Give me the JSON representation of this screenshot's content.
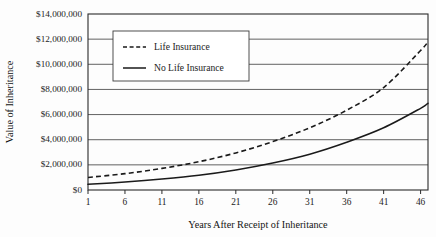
{
  "chart_data": {
    "type": "line",
    "title": "",
    "xlabel": "Years After Receipt of Inheritance",
    "ylabel": "Value of Inheritance",
    "xlim": [
      1,
      47
    ],
    "ylim": [
      0,
      14000000
    ],
    "grid": "horizontal",
    "legend_position": "top-left-inside",
    "x_ticks": [
      1,
      6,
      11,
      16,
      21,
      26,
      31,
      36,
      41,
      46
    ],
    "x_tick_labels": [
      "1",
      "6",
      "11",
      "16",
      "21",
      "26",
      "31",
      "36",
      "41",
      "46"
    ],
    "y_ticks": [
      0,
      2000000,
      4000000,
      6000000,
      8000000,
      10000000,
      12000000,
      14000000
    ],
    "y_tick_labels": [
      "$0",
      "$2,000,000",
      "$4,000,000",
      "$6,000,000",
      "$8,000,000",
      "$10,000,000",
      "$12,000,000",
      "$14,000,000"
    ],
    "x": [
      1,
      6,
      11,
      16,
      21,
      26,
      31,
      36,
      41,
      46,
      47
    ],
    "series": [
      {
        "name": "Life Insurance",
        "style": "dashed",
        "color": "#1a1a1a",
        "values": [
          1000000,
          1300000,
          1720000,
          2250000,
          2950000,
          3850000,
          4950000,
          6350000,
          8150000,
          11100000,
          11800000
        ]
      },
      {
        "name": "No Life Insurance",
        "style": "solid",
        "color": "#1a1a1a",
        "values": [
          450000,
          640000,
          880000,
          1180000,
          1600000,
          2150000,
          2850000,
          3800000,
          4950000,
          6500000,
          6900000
        ]
      }
    ]
  },
  "legend": {
    "entries": [
      {
        "label": "Life Insurance",
        "style": "dashed"
      },
      {
        "label": "No Life Insurance",
        "style": "solid"
      }
    ]
  },
  "colors": {
    "background": "#fdfdfd",
    "ink": "#1a1a1a",
    "grid": "#3a3a3a"
  }
}
